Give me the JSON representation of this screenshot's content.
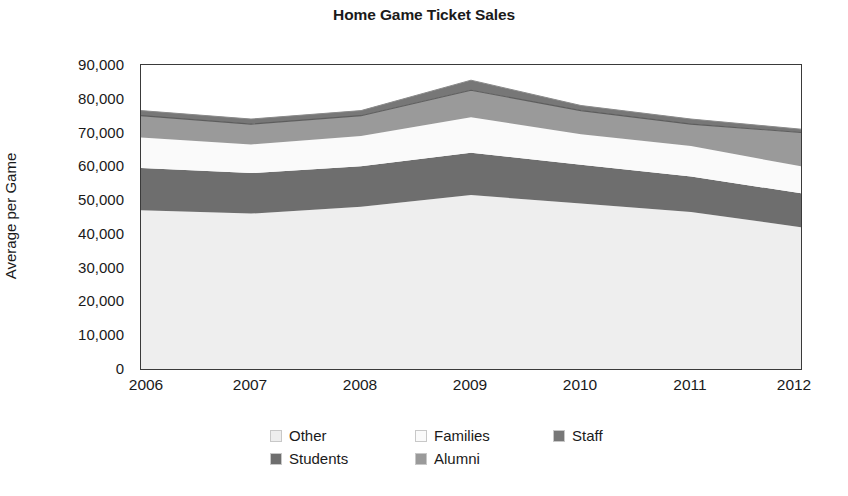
{
  "chart_data": {
    "type": "area",
    "title": "Home Game Ticket Sales",
    "xlabel": "",
    "ylabel": "Average per Game",
    "stacked": true,
    "grid": false,
    "legend_position": "bottom",
    "x": [
      2006,
      2007,
      2008,
      2009,
      2010,
      2011,
      2012
    ],
    "categories": [
      "2006",
      "2007",
      "2008",
      "2009",
      "2010",
      "2011",
      "2012"
    ],
    "xlim": [
      2006,
      2012
    ],
    "ylim": [
      0,
      90000
    ],
    "ytick_values": [
      0,
      10000,
      20000,
      30000,
      40000,
      50000,
      60000,
      70000,
      80000,
      90000
    ],
    "ytick_labels": [
      "0",
      "10,000",
      "20,000",
      "30,000",
      "40,000",
      "50,000",
      "60,000",
      "70,000",
      "80,000",
      "90,000"
    ],
    "xtick_labels": [
      "2006",
      "2007",
      "2008",
      "2009",
      "2010",
      "2011",
      "2012"
    ],
    "series": [
      {
        "name": "Other",
        "color": "#eeeeee",
        "values": [
          47000,
          46000,
          48000,
          51500,
          49000,
          46500,
          42000
        ]
      },
      {
        "name": "Students",
        "color": "#6e6e6e",
        "values": [
          12500,
          12000,
          12000,
          12500,
          11500,
          10500,
          10000
        ]
      },
      {
        "name": "Families",
        "color": "#fafafa",
        "values": [
          9000,
          8500,
          9000,
          10500,
          9000,
          9000,
          8000
        ]
      },
      {
        "name": "Alumni",
        "color": "#9a9a9a",
        "values": [
          6500,
          6000,
          6000,
          8000,
          7000,
          6500,
          10000
        ]
      },
      {
        "name": "Staff",
        "color": "#777777",
        "values": [
          1500,
          1500,
          1500,
          3000,
          1500,
          1500,
          1000
        ]
      }
    ],
    "cumulative_tops": {
      "Other": [
        47000,
        46000,
        48000,
        51500,
        49000,
        46500,
        42000
      ],
      "Students": [
        59500,
        58000,
        60000,
        64000,
        60500,
        57000,
        52000
      ],
      "Families": [
        68500,
        66500,
        69000,
        74500,
        69500,
        66000,
        60000
      ],
      "Alumni": [
        75000,
        72500,
        75000,
        82500,
        76500,
        72500,
        70000
      ],
      "Staff": [
        76500,
        74000,
        76500,
        85500,
        78000,
        74000,
        71000
      ]
    }
  },
  "legend": {
    "entries": [
      {
        "label": "Other"
      },
      {
        "label": "Families"
      },
      {
        "label": "Staff"
      },
      {
        "label": "Students"
      },
      {
        "label": "Alumni"
      }
    ]
  }
}
